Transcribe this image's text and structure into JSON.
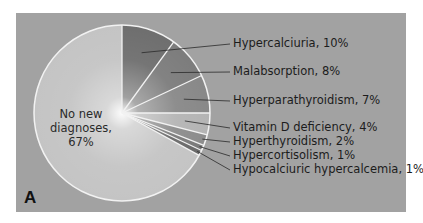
{
  "chart_data": {
    "type": "pie",
    "title": "",
    "panel_label": "A",
    "start_angle": "12 o'clock",
    "direction": "clockwise",
    "slices": [
      {
        "label": "Hypercalciuria",
        "value": 10,
        "display": "Hypercalciuria, 10%",
        "color": "#6e6e6e"
      },
      {
        "label": "Malabsorption",
        "value": 8,
        "display": "Malabsorption, 8%",
        "color": "#7c7c7c"
      },
      {
        "label": "Hyperparathyroidism",
        "value": 7,
        "display": "Hyperparathyroidism, 7%",
        "color": "#888888"
      },
      {
        "label": "Vitamin D deficiency",
        "value": 4,
        "display": "Vitamin D deficiency, 4%",
        "color": "#b4b4b4"
      },
      {
        "label": "Hyperthyroidism",
        "value": 2,
        "display": "Hyperthyroidism, 2%",
        "color": "#8c8c8c"
      },
      {
        "label": "Hypercortisolism",
        "value": 1,
        "display": "Hypercortisolism, 1%",
        "color": "#7a7a7a"
      },
      {
        "label": "Hypocalciuric hypercalcemia",
        "value": 1,
        "display": "Hypocalciuric hypercalcemia, 1%",
        "color": "#6a6a6a"
      },
      {
        "label": "No new diagnoses",
        "value": 67,
        "display": "No new diagnoses, 67%",
        "color": "#c4c4c4"
      }
    ],
    "center_label_lines": [
      "No new",
      "diagnoses,",
      "67%"
    ]
  },
  "colors": {
    "panel_background": "#a2a2a2",
    "slice_border": "#f2f2f2",
    "leader_line": "#2a2a2a"
  }
}
